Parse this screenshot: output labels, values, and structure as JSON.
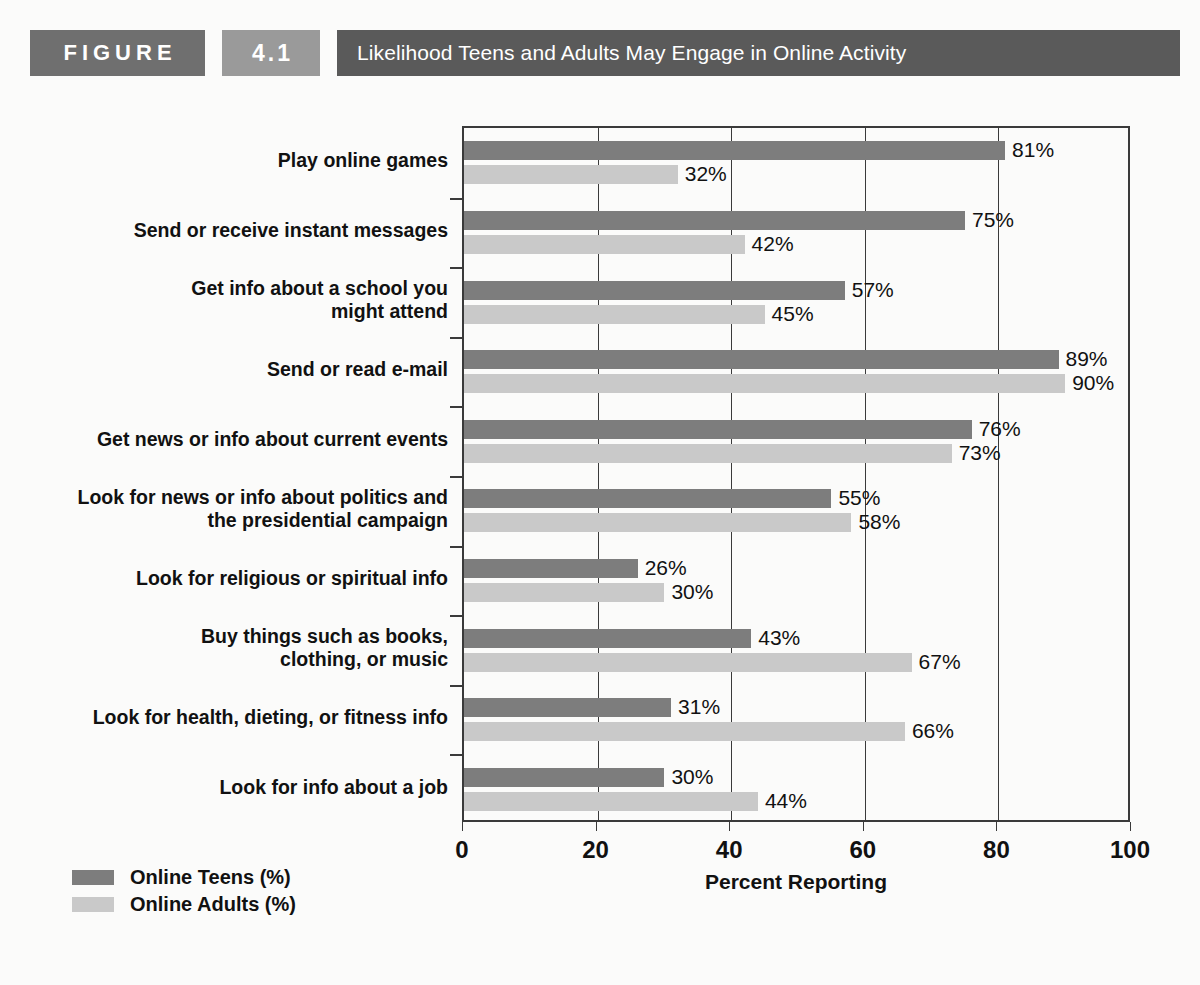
{
  "header": {
    "figure_word": "FIGURE",
    "figure_number": "4.1",
    "title": "Likelihood Teens and Adults May Engage in Online Activity",
    "colors": {
      "figure_box": "#6f6f6f",
      "number_box": "#9a9a9a",
      "title_box": "#5a5a5a"
    }
  },
  "legend": {
    "items": [
      {
        "label": "Online Teens (%)",
        "color": "#7d7d7d",
        "key": "teens"
      },
      {
        "label": "Online Adults (%)",
        "color": "#c9c9c9",
        "key": "adults"
      }
    ]
  },
  "chart_data": {
    "type": "bar",
    "orientation": "horizontal",
    "title": "Likelihood Teens and Adults May Engage in Online Activity",
    "xlabel": "Percent Reporting",
    "ylabel": "",
    "xlim": [
      0,
      100
    ],
    "xticks": [
      0,
      20,
      40,
      60,
      80,
      100
    ],
    "ticklabels": [
      "0",
      "20",
      "40",
      "60",
      "80",
      "100"
    ],
    "grid": "vertical",
    "legend_position": "bottom-left",
    "value_suffix": "%",
    "categories": [
      "Play online games",
      "Send or receive instant messages",
      "Get info about a school you might attend",
      "Send or read e-mail",
      "Get news or info about current events",
      "Look for news or info about politics and the presidential campaign",
      "Look for religious or spiritual info",
      "Buy things such as books, clothing, or music",
      "Look for health, dieting, or fitness info",
      "Look for info about a job"
    ],
    "category_lines": [
      [
        "Play online games"
      ],
      [
        "Send or receive instant messages"
      ],
      [
        "Get info about a school you",
        "might attend"
      ],
      [
        "Send or read e-mail"
      ],
      [
        "Get news or info about current events"
      ],
      [
        "Look for news or info about politics and",
        "the presidential campaign"
      ],
      [
        "Look for religious or spiritual info"
      ],
      [
        "Buy things such as books,",
        "clothing, or music"
      ],
      [
        "Look for health, dieting, or fitness info"
      ],
      [
        "Look for info about a job"
      ]
    ],
    "series": [
      {
        "name": "Online Teens (%)",
        "color": "#7d7d7d",
        "values": [
          81,
          75,
          57,
          89,
          76,
          55,
          26,
          43,
          31,
          30
        ],
        "labels": [
          "81%",
          "75%",
          "57%",
          "89%",
          "76%",
          "55%",
          "26%",
          "43%",
          "31%",
          "30%"
        ]
      },
      {
        "name": "Online Adults (%)",
        "color": "#c9c9c9",
        "values": [
          32,
          42,
          45,
          90,
          73,
          58,
          30,
          67,
          66,
          44
        ],
        "labels": [
          "32%",
          "42%",
          "45%",
          "90%",
          "73%",
          "58%",
          "30%",
          "67%",
          "66%",
          "44%"
        ]
      }
    ]
  }
}
